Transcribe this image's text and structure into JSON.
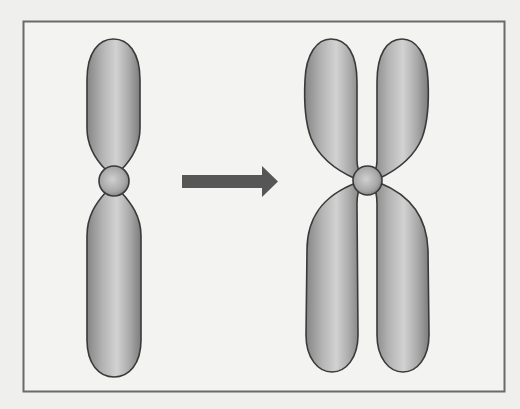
{
  "diagram": {
    "elements": [
      {
        "id": "single-chromosome",
        "label": "Unreplicated chromosome"
      },
      {
        "id": "process-arrow",
        "label": "Arrow indicating replication"
      },
      {
        "id": "replicated-chromosome",
        "label": "Replicated chromosome (two sister chromatids)"
      }
    ],
    "text_labels": []
  },
  "colors": {
    "background": "#efefed",
    "frame": "#6a6a6a",
    "chromosome_outline": "#3a3a3a",
    "chromosome_fill_light": "#d6d6d6",
    "chromosome_fill_dark": "#7e7e7e",
    "arrow": "#565656"
  }
}
